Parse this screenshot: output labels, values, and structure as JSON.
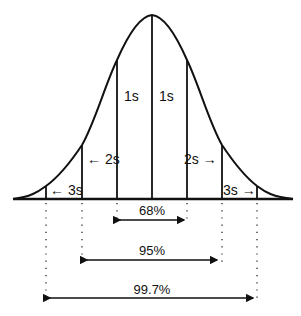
{
  "diagram": {
    "type": "normal-distribution",
    "labels": {
      "left_1s": "1s",
      "right_1s": "1s",
      "left_2s": "← 2s",
      "right_2s": "2s →",
      "left_3s": "← 3s",
      "right_3s": "3s →"
    },
    "ranges": [
      {
        "label": "68%",
        "from": "-1s",
        "to": "+1s"
      },
      {
        "label": "95%",
        "from": "-2s",
        "to": "+2s"
      },
      {
        "label": "99.7%",
        "from": "-3s",
        "to": "+3s"
      }
    ],
    "line_color": "#111111",
    "background": "#ffffff"
  }
}
